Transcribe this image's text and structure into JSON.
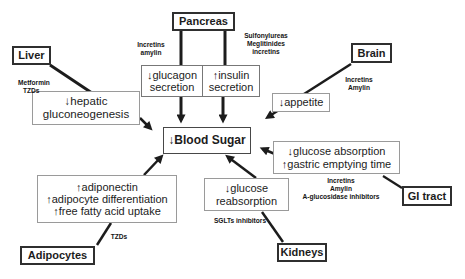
{
  "colors": {
    "background": "#ffffff",
    "box_border_dark": "#2f2f2f",
    "box_border_light": "#9a9a9a",
    "arrow": "#1c1c1c",
    "text": "#1c1c1c"
  },
  "nodes": {
    "pancreas": {
      "label": "Pancreas"
    },
    "liver": {
      "label": "Liver"
    },
    "brain": {
      "label": "Brain"
    },
    "gi_tract": {
      "label": "GI tract"
    },
    "adipocytes": {
      "label": "Adipocytes"
    },
    "kidneys": {
      "label": "Kidneys"
    },
    "blood_sugar": {
      "label": "↓Blood Sugar"
    },
    "glucagon": {
      "lines": [
        "↓glucagon",
        "secretion"
      ]
    },
    "insulin": {
      "lines": [
        "↑insulin",
        "secretion"
      ]
    },
    "hepatic": {
      "lines": [
        "↓hepatic",
        "gluconeogenesis"
      ]
    },
    "appetite": {
      "label": "↓appetite"
    },
    "absorption": {
      "lines": [
        "↓glucose absorption",
        "↑gastric emptying time"
      ]
    },
    "adipocyte_effects": {
      "lines": [
        "↑adiponectin",
        "↑adipocyte differentiation",
        "↑free fatty acid uptake"
      ]
    },
    "reabsorption": {
      "lines": [
        "↓glucose",
        "reabsorption"
      ]
    }
  },
  "drug_labels": {
    "pancreas_left": {
      "lines": [
        "Incretins",
        "amylin"
      ]
    },
    "pancreas_right": {
      "lines": [
        "Sulfonylureas",
        "Meglitinides",
        "incretins"
      ]
    },
    "liver": {
      "lines": [
        "Metformin",
        "TZDs"
      ]
    },
    "brain": {
      "lines": [
        "Incretins",
        "Amylin"
      ]
    },
    "gi_tract": {
      "lines": [
        "Incretins",
        "Amylin",
        "A-glucosidase inhibitors"
      ]
    },
    "kidneys": {
      "label": "SGLTs inhibitors"
    },
    "adipocytes": {
      "label": "TZDs"
    }
  }
}
